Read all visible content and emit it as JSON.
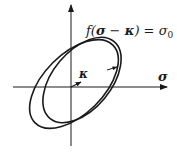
{
  "diagram": {
    "title_equation": {
      "prefix": "f(",
      "var1": "σ",
      "minus": " − ",
      "var2": "κ",
      "suffix": ") = ",
      "rhs": "σ",
      "rhs_sub": "0"
    },
    "axis_x_label": "σ",
    "center_shift_label": "κ",
    "shapes": {
      "outer_ellipse": "initial yield surface",
      "inner_ellipse": "shifted yield surface"
    },
    "colors": {
      "stroke": "#1a1a1a",
      "background": "#ffffff"
    }
  }
}
